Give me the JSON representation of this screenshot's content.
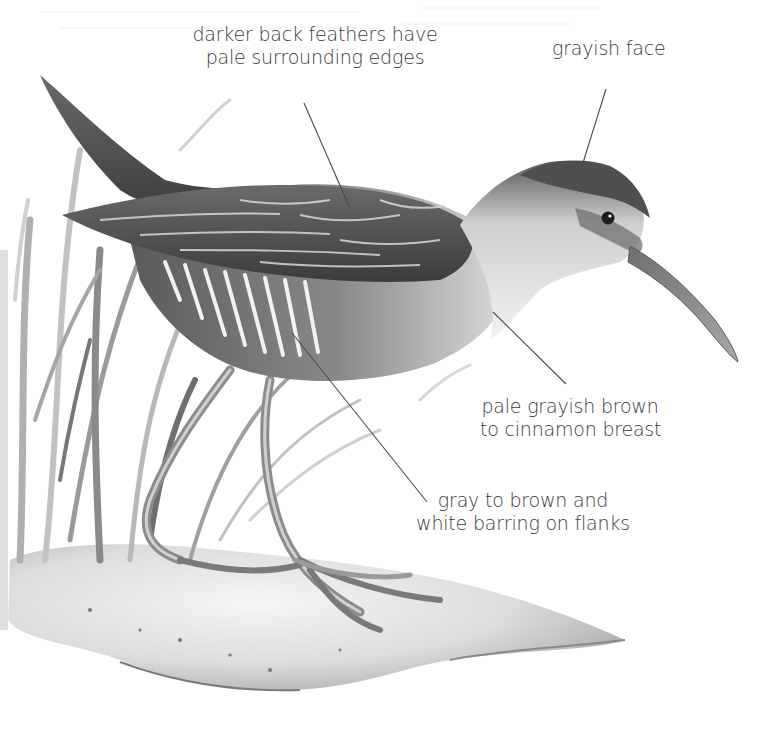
{
  "figure": {
    "palette": {
      "ink": "#3a3a3a",
      "leader": "#4a4a4a",
      "dark": "#2e2e2e",
      "mid": "#7a7a7a",
      "light": "#bdbdbd",
      "paper": "#ffffff"
    }
  },
  "annotations": [
    {
      "id": "back-feathers",
      "lines": [
        "darker back feathers have",
        "pale surrounding edges"
      ],
      "box": {
        "x": 190,
        "y": 23,
        "w": 250,
        "align": "center"
      },
      "leader": {
        "x1": 304,
        "y1": 103,
        "x2": 349,
        "y2": 206
      }
    },
    {
      "id": "grayish-face",
      "lines": [
        "grayish face"
      ],
      "box": {
        "x": 552,
        "y": 37,
        "w": 110,
        "align": "center"
      },
      "leader": {
        "x1": 606,
        "y1": 89,
        "x2": 582,
        "y2": 166
      }
    },
    {
      "id": "breast",
      "lines": [
        "pale grayish brown",
        "to cinnamon breast"
      ],
      "box": {
        "x": 480,
        "y": 395,
        "w": 180,
        "align": "center"
      },
      "leader": {
        "x1": 493,
        "y1": 312,
        "x2": 566,
        "y2": 384
      }
    },
    {
      "id": "flanks",
      "lines": [
        "gray to brown and",
        "white barring on flanks"
      ],
      "box": {
        "x": 413,
        "y": 489,
        "w": 220,
        "align": "center"
      },
      "leader": {
        "x1": 292,
        "y1": 333,
        "x2": 427,
        "y2": 502
      }
    }
  ]
}
